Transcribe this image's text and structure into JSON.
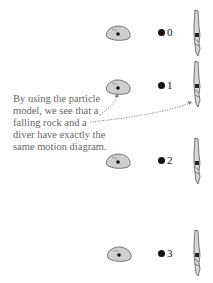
{
  "caption": {
    "lines": [
      "By using the particle",
      "model, we see that a",
      "falling rock and a",
      "diver have exactly the",
      "same motion diagram."
    ]
  },
  "frames": [
    {
      "label": "0",
      "rock_y": 24,
      "dot_y": 33,
      "diver_y": 9
    },
    {
      "label": "1",
      "rock_y": 78,
      "dot_y": 86,
      "diver_y": 60
    },
    {
      "label": "2",
      "rock_y": 152,
      "dot_y": 161,
      "diver_y": 137
    },
    {
      "label": "3",
      "rock_y": 245,
      "dot_y": 254,
      "diver_y": 229
    }
  ],
  "colors": {
    "rock_fill": "#cfcfcf",
    "rock_stroke": "#555555",
    "text": "#666666",
    "dot": "#111111"
  }
}
